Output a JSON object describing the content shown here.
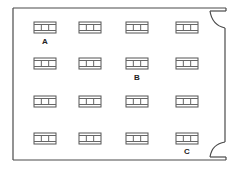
{
  "diagram": {
    "type": "classroom-floor-plan",
    "room": {
      "left": 13,
      "top": 8,
      "right": 225,
      "bottom": 160,
      "wall_color": "#4a4a4a"
    },
    "doors": [
      {
        "id": "door-top-right",
        "position": "top-right"
      },
      {
        "id": "door-bottom-right",
        "position": "bottom-right"
      }
    ],
    "desk_columns_x": [
      34,
      79,
      126,
      176
    ],
    "desk_rows_y": [
      22,
      58,
      96,
      133
    ],
    "desk_size": {
      "width": 22,
      "height": 11
    },
    "labels": [
      {
        "text": "A",
        "x": 45,
        "y": 44,
        "near": "row 1, column 1"
      },
      {
        "text": "B",
        "x": 137,
        "y": 80,
        "near": "row 2, column 3"
      },
      {
        "text": "C",
        "x": 187,
        "y": 154,
        "near": "row 4, column 4"
      }
    ]
  }
}
